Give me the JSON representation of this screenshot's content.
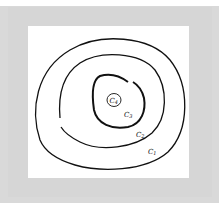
{
  "caption_fragment": "",
  "diagram": {
    "type": "nested-closed-curves",
    "curves": [
      {
        "id": "C1",
        "label": "C",
        "subscript": "1",
        "closed": true
      },
      {
        "id": "C2",
        "label": "C",
        "subscript": "2",
        "closed": false
      },
      {
        "id": "C3",
        "label": "C",
        "subscript": "3",
        "closed": false
      },
      {
        "id": "C4",
        "label": "C",
        "subscript": "4",
        "closed": true
      }
    ],
    "colors": {
      "stroke": "#111111",
      "panel": "#ffffff",
      "frame": "#d6d6d6"
    }
  }
}
